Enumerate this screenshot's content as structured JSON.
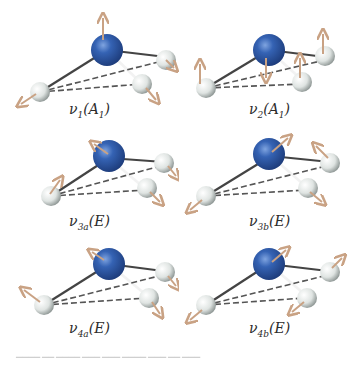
{
  "figure": {
    "colors": {
      "central_atom": "#2f5aa8",
      "outer_atom": "#dfe3e2",
      "bond": "#444444",
      "dashed_edge": "#555555",
      "arrow": "#c9a284"
    },
    "panels": [
      {
        "id": "v1",
        "symbol": "ν",
        "index": "1",
        "symmetry": "A",
        "sym_index": "1",
        "label": "ν1(A1)"
      },
      {
        "id": "v2",
        "symbol": "ν",
        "index": "2",
        "symmetry": "A",
        "sym_index": "1",
        "label": "ν2(A1)"
      },
      {
        "id": "v3a",
        "symbol": "ν",
        "index": "3a",
        "symmetry": "E",
        "sym_index": "",
        "label": "ν3a(E)"
      },
      {
        "id": "v3b",
        "symbol": "ν",
        "index": "3b",
        "symmetry": "E",
        "sym_index": "",
        "label": "ν3b(E)"
      },
      {
        "id": "v4a",
        "symbol": "ν",
        "index": "4a",
        "symmetry": "E",
        "sym_index": "",
        "label": "ν4a(E)"
      },
      {
        "id": "v4b",
        "symbol": "ν",
        "index": "4b",
        "symmetry": "E",
        "sym_index": "",
        "label": "ν4b(E)"
      }
    ]
  }
}
